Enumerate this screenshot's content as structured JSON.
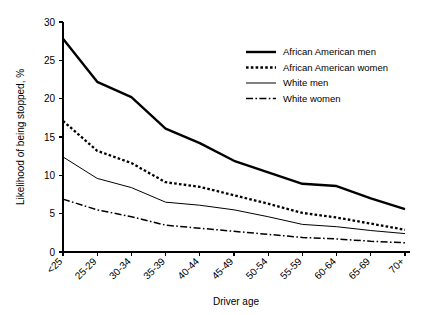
{
  "chart_data": {
    "type": "line",
    "title": "",
    "subtitle": "",
    "xlabel": "Driver age",
    "ylabel": "Likelihood of being stopped, %",
    "categories": [
      "<25",
      "25-29",
      "30-34",
      "35-39",
      "40-44",
      "45-49",
      "50-54",
      "55-59",
      "60-64",
      "65-69",
      "70+"
    ],
    "ylim": [
      0,
      30
    ],
    "yticks": [
      0,
      5,
      10,
      15,
      20,
      25,
      30
    ],
    "ytick_labels": [
      "0",
      "5",
      "10",
      "15",
      "20",
      "25",
      "30"
    ],
    "grid": false,
    "legend_position": "top-right",
    "series": [
      {
        "name": "African American men",
        "style": "solid-thick",
        "color": "#000000",
        "values": [
          27.8,
          22.2,
          20.2,
          16.1,
          14.2,
          11.9,
          10.4,
          8.9,
          8.6,
          7.0,
          5.6
        ]
      },
      {
        "name": "African American women",
        "style": "dotted",
        "color": "#000000",
        "values": [
          17.1,
          13.2,
          11.6,
          9.1,
          8.5,
          7.4,
          6.3,
          5.1,
          4.5,
          3.7,
          2.9
        ]
      },
      {
        "name": "White men",
        "style": "solid-thin",
        "color": "#000000",
        "values": [
          12.4,
          9.6,
          8.4,
          6.5,
          6.1,
          5.5,
          4.6,
          3.6,
          3.3,
          2.8,
          2.4
        ]
      },
      {
        "name": "White women",
        "style": "dash-dot",
        "color": "#000000",
        "values": [
          6.9,
          5.5,
          4.6,
          3.5,
          3.1,
          2.7,
          2.3,
          1.9,
          1.7,
          1.4,
          1.2
        ]
      }
    ]
  },
  "legend": {
    "items": [
      {
        "label": "African American men"
      },
      {
        "label": "African American women"
      },
      {
        "label": "White men"
      },
      {
        "label": "White women"
      }
    ]
  }
}
